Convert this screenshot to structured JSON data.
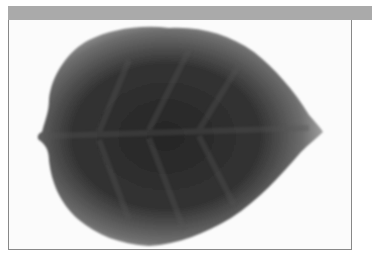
{
  "image": {
    "subject": "leaf-silhouette",
    "description": "Grayscale leaf image with dark center and lighter serrated edges, pointing right",
    "colors": {
      "frame_bar": "#aaaaaa",
      "border": "#888888",
      "leaf_dark": "#2a2a2a",
      "leaf_edge": "#b5b5b5",
      "background": "#fbfbfb"
    }
  }
}
